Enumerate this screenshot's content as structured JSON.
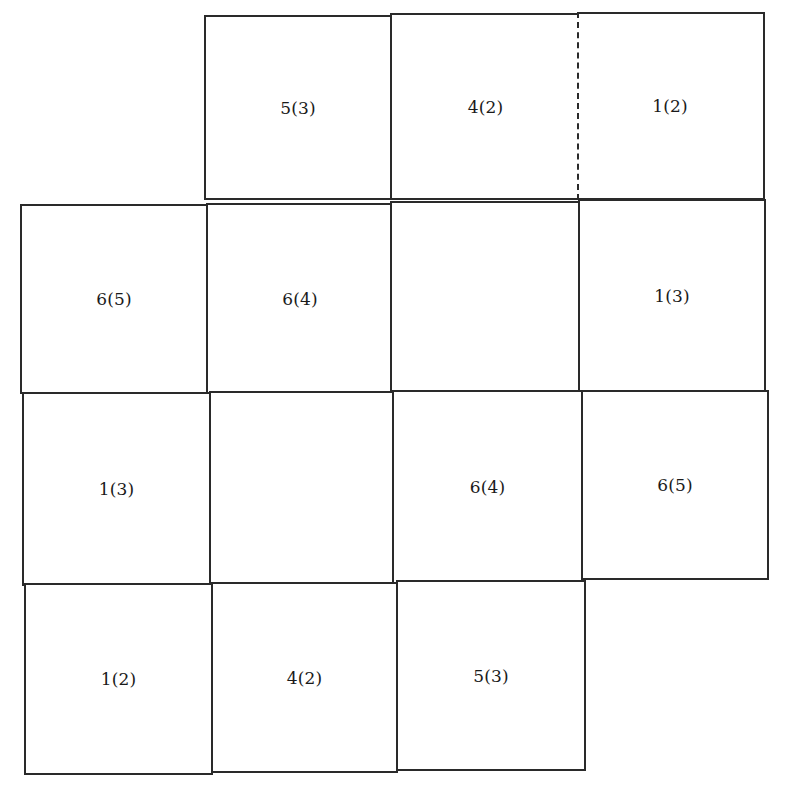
{
  "grid": {
    "description": "Irregular grid of square cells, each labeled with a number and a parenthesized number",
    "rows": 4,
    "cols": 4,
    "cells": [
      {
        "row": 0,
        "col": 1,
        "label": "5(3)"
      },
      {
        "row": 0,
        "col": 2,
        "label": "4(2)"
      },
      {
        "row": 0,
        "col": 3,
        "label": "1(2)"
      },
      {
        "row": 1,
        "col": 0,
        "label": "6(5)"
      },
      {
        "row": 1,
        "col": 1,
        "label": "6(4)"
      },
      {
        "row": 1,
        "col": 2,
        "label": ""
      },
      {
        "row": 1,
        "col": 3,
        "label": "1(3)"
      },
      {
        "row": 2,
        "col": 0,
        "label": "1(3)"
      },
      {
        "row": 2,
        "col": 1,
        "label": ""
      },
      {
        "row": 2,
        "col": 2,
        "label": "6(4)"
      },
      {
        "row": 2,
        "col": 3,
        "label": "6(5)"
      },
      {
        "row": 3,
        "col": 0,
        "label": "1(2)"
      },
      {
        "row": 3,
        "col": 1,
        "label": "4(2)"
      },
      {
        "row": 3,
        "col": 2,
        "label": "5(3)"
      }
    ],
    "dashed_boundary": {
      "between": [
        "0,2",
        "0,3"
      ],
      "style": "dashed"
    },
    "line_color": "#2a2a2a",
    "background_color": "#ffffff"
  }
}
